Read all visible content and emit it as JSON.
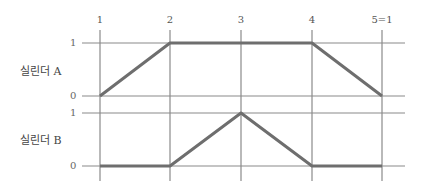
{
  "diagram": {
    "type": "displacement-step diagram",
    "steps": [
      "1",
      "2",
      "3",
      "4",
      "5=1"
    ],
    "colors": {
      "grid": "#8a8a8a",
      "trace": "#6e6e6e",
      "text": "#444444"
    },
    "cylinders": [
      {
        "label": "실린더 A",
        "levels": {
          "high": "1",
          "low": "0"
        },
        "states": [
          0,
          1,
          1,
          1,
          0
        ]
      },
      {
        "label": "실린더 B",
        "levels": {
          "high": "1",
          "low": "0"
        },
        "states": [
          0,
          0,
          1,
          0,
          0
        ]
      }
    ]
  }
}
